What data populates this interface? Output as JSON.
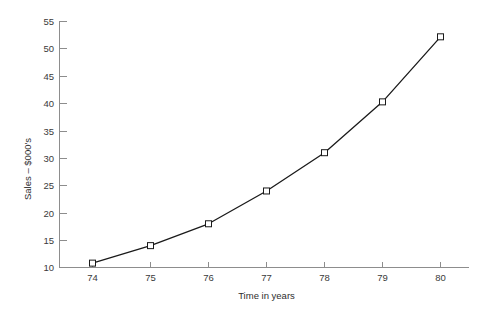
{
  "chart_data": {
    "type": "line",
    "title": "",
    "subtitle": "",
    "xlabel": "Time in years",
    "ylabel": "Sales – $000's",
    "x": [
      74,
      75,
      76,
      77,
      78,
      79,
      80
    ],
    "values": [
      10.8,
      14.0,
      18.0,
      24.0,
      31.0,
      40.3,
      52.2
    ],
    "series": [
      {
        "name": "Sales",
        "values": [
          10.8,
          14.0,
          18.0,
          24.0,
          31.0,
          40.3,
          52.2
        ]
      }
    ],
    "xtick_labels": [
      "74",
      "75",
      "76",
      "77",
      "78",
      "79",
      "80"
    ],
    "ytick_labels": [
      "10",
      "15",
      "20",
      "25",
      "30",
      "35",
      "40",
      "45",
      "50",
      "55"
    ],
    "ytick_values": [
      10,
      15,
      20,
      25,
      30,
      35,
      40,
      45,
      50,
      55
    ],
    "xlim": [
      73.6,
      80.6
    ],
    "ylim": [
      10,
      55
    ],
    "grid": false,
    "legend": "none",
    "marker": "open-square",
    "line_color": "#1a1a1a",
    "marker_fill": "#ffffff",
    "axis_color": "#8d8d8d",
    "text_color": "#3a3a3a"
  },
  "axes": {
    "y_title": "Sales – $000's",
    "x_title": "Time in years"
  }
}
